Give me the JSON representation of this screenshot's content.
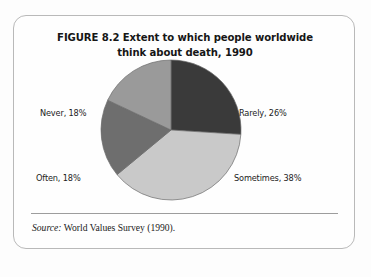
{
  "figure": {
    "title": "FIGURE 8.2  Extent to which people worldwide think about death, 1990",
    "source_label": "Source:",
    "source_text": " World Values Survey (1990)."
  },
  "colors": {
    "rarely": "#3a3a3a",
    "sometimes": "#c9c9c9",
    "often": "#6e6e6e",
    "never": "#9a9a9a",
    "slice_stroke": "#6a6a6a",
    "frame_border": "#b9b9b9",
    "rule": "#9d9d9d",
    "text": "#1a1a1a"
  },
  "labels": {
    "never": "Never, 18%",
    "often": "Often, 18%",
    "rarely": "Rarely, 26%",
    "sometimes": "Sometimes, 38%"
  },
  "chart_data": {
    "type": "pie",
    "title": "FIGURE 8.2  Extent to which people worldwide think about death, 1990",
    "xlabel": "",
    "ylabel": "",
    "legend_position": "none",
    "grid": false,
    "units": "percent",
    "total": 100,
    "start_angle_deg": 0,
    "direction": "clockwise",
    "categories": [
      "Rarely",
      "Sometimes",
      "Often",
      "Never"
    ],
    "values": [
      26,
      38,
      18,
      18
    ],
    "slices": [
      {
        "name": "Rarely",
        "value": 26,
        "label": "Rarely, 26%",
        "color": "#3a3a3a",
        "label_side": "right-top"
      },
      {
        "name": "Sometimes",
        "value": 38,
        "label": "Sometimes, 38%",
        "color": "#c9c9c9",
        "label_side": "right-bottom"
      },
      {
        "name": "Often",
        "value": 18,
        "label": "Often, 18%",
        "color": "#6e6e6e",
        "label_side": "left-bottom"
      },
      {
        "name": "Never",
        "value": 18,
        "label": "Never, 18%",
        "color": "#9a9a9a",
        "label_side": "left-top"
      }
    ],
    "annotations": [
      "Source: World Values Survey (1990)."
    ]
  }
}
